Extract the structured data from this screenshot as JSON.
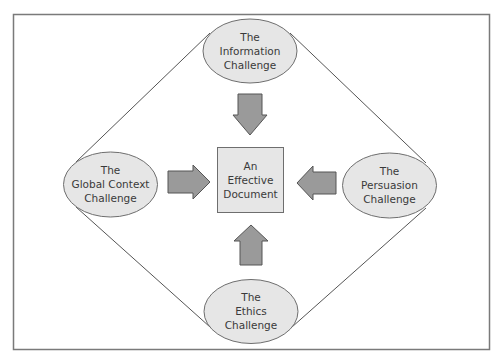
{
  "diagram": {
    "center": {
      "label": "An\nEffective\nDocument"
    },
    "challenges": [
      {
        "id": "information",
        "label": "The\nInformation\nChallenge",
        "position": "top"
      },
      {
        "id": "global-context",
        "label": "The\nGlobal Context\nChallenge",
        "position": "left"
      },
      {
        "id": "persuasion",
        "label": "The\nPersuasion\nChallenge",
        "position": "right"
      },
      {
        "id": "ethics",
        "label": "The\nEthics\nChallenge",
        "position": "bottom"
      }
    ],
    "arrows": [
      {
        "from": "information",
        "to": "center",
        "direction": "down"
      },
      {
        "from": "global-context",
        "to": "center",
        "direction": "right"
      },
      {
        "from": "persuasion",
        "to": "center",
        "direction": "left"
      },
      {
        "from": "ethics",
        "to": "center",
        "direction": "up"
      }
    ],
    "colors": {
      "frame": "#7a7a7a",
      "shape_fill": "#e6e6e6",
      "shape_stroke": "#6e6e6e",
      "arrow_fill": "#9a9a9a",
      "arrow_stroke": "#555555",
      "connector": "#555555",
      "text": "#3a3a3a"
    }
  }
}
